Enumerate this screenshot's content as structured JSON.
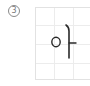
{
  "item": {
    "number": "3",
    "number_style": "circled",
    "character": "아",
    "grid": {
      "columns": 3,
      "rows": 4,
      "line_color": "#ececec",
      "border_color": "#e2e2e2"
    },
    "ink_color": "#2a2a2a"
  }
}
